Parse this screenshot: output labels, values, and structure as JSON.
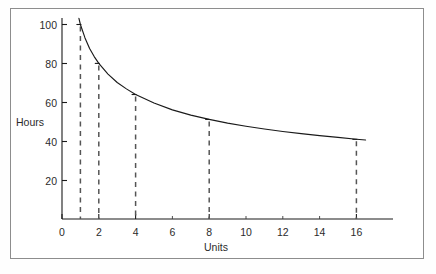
{
  "chart_data": {
    "type": "line",
    "title": "",
    "subtitle": "",
    "xlabel": "Units",
    "ylabel": "Hours",
    "xlim": [
      0,
      18
    ],
    "ylim": [
      0,
      110
    ],
    "grid": false,
    "legend": null,
    "x_ticks": [
      0,
      2,
      4,
      6,
      8,
      10,
      12,
      14,
      16
    ],
    "x_tick_labels": [
      "0",
      "2",
      "4",
      "6",
      "8",
      "10",
      "12",
      "14",
      "16"
    ],
    "y_ticks": [
      20,
      40,
      60,
      80,
      100
    ],
    "y_tick_labels": [
      "20",
      "40",
      "60",
      "80",
      "100"
    ],
    "series": [
      {
        "name": "Cumulative average hours per unit",
        "x": [
          0.92,
          1,
          1.25,
          1.5,
          1.75,
          2,
          2.5,
          3,
          3.5,
          4,
          5,
          6,
          7,
          8,
          9,
          10,
          11,
          12,
          13,
          14,
          15,
          16,
          16.5
        ],
        "values": [
          103.2,
          100,
          93.1,
          87.7,
          83.5,
          80,
          74.5,
          70.2,
          66.9,
          64,
          59.6,
          56.1,
          53.4,
          51.2,
          49.3,
          47.7,
          46.3,
          45.0,
          43.9,
          42.9,
          42.0,
          41.0,
          40.6
        ]
      }
    ],
    "annotations": [
      {
        "label": "dashed-drop-line",
        "x": 1,
        "y": 100
      },
      {
        "label": "dashed-drop-line",
        "x": 2,
        "y": 80
      },
      {
        "label": "dashed-drop-line",
        "x": 4,
        "y": 64
      },
      {
        "label": "dashed-drop-line",
        "x": 8,
        "y": 51.2
      },
      {
        "label": "dashed-drop-line",
        "x": 16,
        "y": 40.96
      }
    ]
  },
  "axes": {
    "y_title": "Hours",
    "x_title": "Units",
    "y_labels": [
      "100",
      "80",
      "60",
      "40",
      "20"
    ],
    "x_labels": [
      "0",
      "2",
      "4",
      "6",
      "8",
      "10",
      "12",
      "14",
      "16"
    ]
  }
}
